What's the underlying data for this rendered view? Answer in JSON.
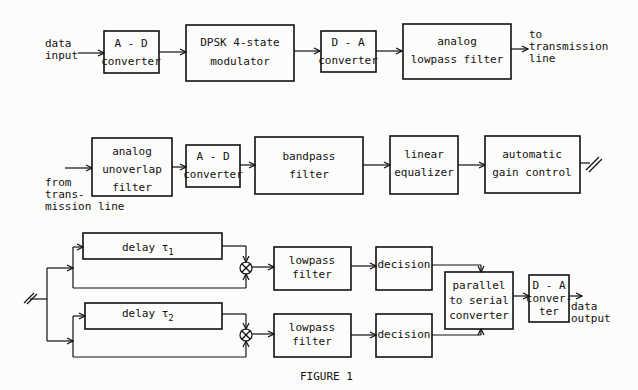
{
  "figure": {
    "caption": "FIGURE 1"
  },
  "row1": {
    "input_label": [
      "data",
      "input"
    ],
    "blocks": [
      {
        "id": "ad1",
        "lines": [
          "A - D",
          "converter"
        ]
      },
      {
        "id": "dpsk",
        "lines": [
          "DPSK  4-state",
          "modulator"
        ]
      },
      {
        "id": "da1",
        "lines": [
          "D - A",
          "converter"
        ]
      },
      {
        "id": "alpf",
        "lines": [
          "analog",
          "lowpass filter"
        ]
      }
    ],
    "output_label": [
      "to",
      "transmission",
      "line"
    ]
  },
  "row2": {
    "input_label": [
      "from",
      "trans-",
      "mission line"
    ],
    "blocks": [
      {
        "id": "auf",
        "lines": [
          "analog",
          "unoverlap",
          "filter"
        ]
      },
      {
        "id": "ad2",
        "lines": [
          "A - D",
          "converter"
        ]
      },
      {
        "id": "bpf",
        "lines": [
          "bandpass",
          "filter"
        ]
      },
      {
        "id": "leq",
        "lines": [
          "linear",
          "equalizer"
        ]
      },
      {
        "id": "agc",
        "lines": [
          "automatic",
          "gain control"
        ]
      }
    ]
  },
  "row3": {
    "delay1": {
      "label": "delay τ",
      "sub": "1"
    },
    "delay2": {
      "label": "delay τ",
      "sub": "2"
    },
    "lpf1": {
      "lines": [
        "lowpass",
        "filter"
      ]
    },
    "lpf2": {
      "lines": [
        "lowpass",
        "filter"
      ]
    },
    "dec1": {
      "lines": [
        "decision"
      ]
    },
    "dec2": {
      "lines": [
        "decision"
      ]
    },
    "p2s": {
      "lines": [
        "parallel",
        "to serial",
        "converter"
      ]
    },
    "da2": {
      "lines": [
        "D - A",
        "conver-",
        "ter"
      ]
    },
    "output_label": [
      "data",
      "output"
    ]
  }
}
